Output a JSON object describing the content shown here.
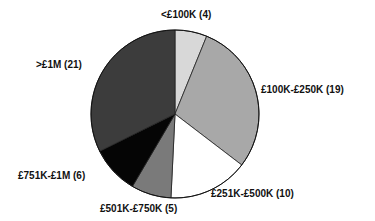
{
  "chart_data": {
    "type": "pie",
    "title": "",
    "start_angle_deg": 0,
    "direction": "clockwise",
    "categories": [
      "<£100K",
      "£100K-£250K",
      "£251K-£500K",
      "£501K-£750K",
      "£751K-£1M",
      ">£1M"
    ],
    "values": [
      4,
      19,
      10,
      5,
      6,
      21
    ],
    "colors": [
      "#d8d8d8",
      "#a8a8a8",
      "#ffffff",
      "#7a7a7a",
      "#050505",
      "#3c3c3c"
    ],
    "labels": [
      "<£100K (4)",
      "£100K-£250K (19)",
      "£251K-£500K (10)",
      "£501K-£750K (5)",
      "£751K-£1M (6)",
      ">£1M (21)"
    ],
    "total": 65
  },
  "label_positions": [
    {
      "left": 161,
      "top": 9
    },
    {
      "left": 261,
      "top": 84
    },
    {
      "left": 211,
      "top": 188
    },
    {
      "left": 100,
      "top": 203
    },
    {
      "left": 18,
      "top": 170
    },
    {
      "left": 36,
      "top": 59
    }
  ]
}
